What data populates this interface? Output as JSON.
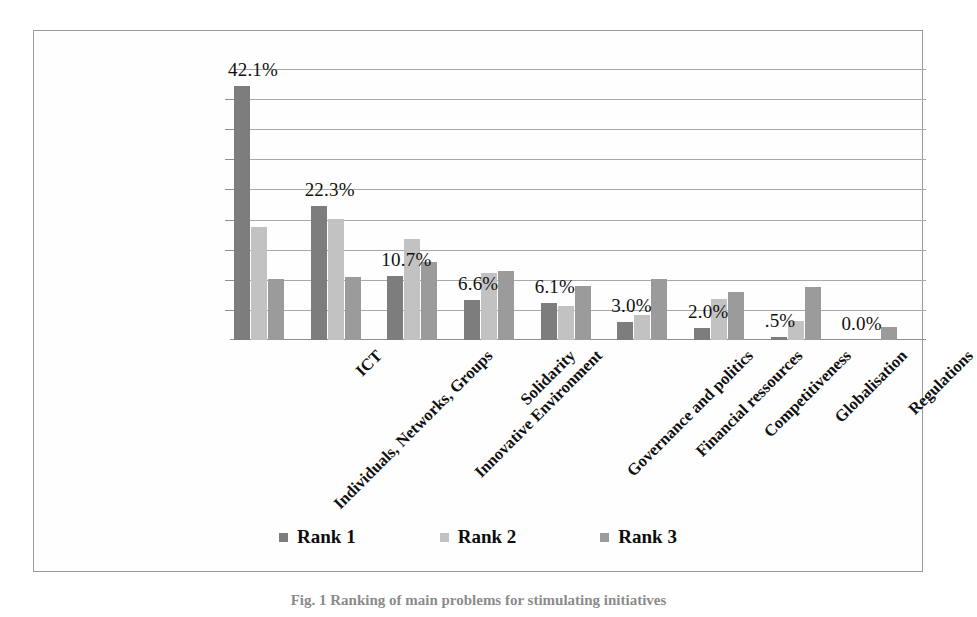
{
  "chart_data": {
    "type": "bar",
    "title": "",
    "xlabel": "",
    "ylabel": "",
    "ylim": [
      0,
      45
    ],
    "grid": true,
    "gridline_count": 9,
    "legend_position": "bottom",
    "categories": [
      "Individuals, Networks, Groups",
      "ICT",
      "Innovative Environment",
      "Solidarity",
      "Governance and politics",
      "Financial ressources",
      "Competitiveness",
      "Globalisation",
      "Regulations"
    ],
    "series": [
      {
        "name": "Rank 1",
        "color": "#7d7d7d",
        "values": [
          42.1,
          22.3,
          10.7,
          6.6,
          6.1,
          3.0,
          2.0,
          0.5,
          0.0
        ]
      },
      {
        "name": "Rank 2",
        "color": "#c2c2c2",
        "values": [
          18.8,
          20.1,
          16.8,
          11.2,
          5.6,
          4.2,
          6.8,
          3.1,
          0.0
        ]
      },
      {
        "name": "Rank 3",
        "color": "#9b9b9b",
        "values": [
          10.2,
          10.4,
          13.0,
          11.4,
          9.0,
          10.1,
          8.0,
          8.8,
          2.2
        ]
      }
    ],
    "data_labels": [
      "42.1%",
      "22.3%",
      "10.7%",
      "6.6%",
      "6.1%",
      "3.0%",
      "2.0%",
      ".5%",
      "0.0%"
    ]
  },
  "legend": {
    "items": [
      {
        "label": "Rank 1",
        "swatch": "rank1-swatch"
      },
      {
        "label": "Rank 2",
        "swatch": "rank2-swatch"
      },
      {
        "label": "Rank 3",
        "swatch": "rank3-swatch"
      }
    ]
  },
  "caption": {
    "text": "Fig. 1  Ranking of main problems for stimulating initiatives"
  }
}
